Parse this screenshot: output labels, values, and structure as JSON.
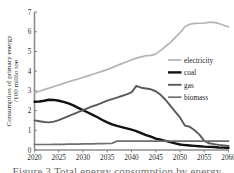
{
  "chart_data": {
    "type": "line",
    "title": "",
    "xlabel": "",
    "ylabel": "Consumption of primary energy /100 millio toe",
    "ylabel_line1": "Consumption of primary energy",
    "ylabel_line2": "/100 millio toe",
    "xlim": [
      2020,
      2060
    ],
    "ylim": [
      0,
      7
    ],
    "yticks": [
      0,
      1,
      2,
      3,
      4,
      5,
      6,
      7
    ],
    "xticks": [
      2020,
      2025,
      2030,
      2035,
      2040,
      2045,
      2050,
      2055,
      2060
    ],
    "xtick_labels": [
      "2020",
      "2025",
      "2030",
      "2035",
      "2040",
      "2045",
      "2050",
      "2055",
      "2060"
    ],
    "ytick_labels": [
      "0",
      "1",
      "2",
      "3",
      "4",
      "5",
      "6",
      "7"
    ],
    "grid": false,
    "legend_position": "center-right",
    "x": [
      2020,
      2021,
      2022,
      2023,
      2024,
      2025,
      2026,
      2027,
      2028,
      2029,
      2030,
      2031,
      2032,
      2033,
      2034,
      2035,
      2036,
      2037,
      2038,
      2039,
      2040,
      2041,
      2042,
      2043,
      2044,
      2045,
      2046,
      2047,
      2048,
      2049,
      2050,
      2051,
      2052,
      2053,
      2054,
      2055,
      2056,
      2057,
      2058,
      2059,
      2060
    ],
    "series": [
      {
        "name": "electricity",
        "color": "#b4b4b4",
        "width": 1.7,
        "values": [
          2.9,
          2.98,
          3.06,
          3.14,
          3.22,
          3.3,
          3.38,
          3.46,
          3.53,
          3.6,
          3.68,
          3.76,
          3.84,
          3.92,
          4.0,
          4.08,
          4.18,
          4.28,
          4.38,
          4.48,
          4.58,
          4.66,
          4.72,
          4.78,
          4.8,
          4.86,
          5.05,
          5.25,
          5.45,
          5.7,
          5.95,
          6.25,
          6.38,
          6.42,
          6.43,
          6.44,
          6.48,
          6.47,
          6.42,
          6.33,
          6.25
        ]
      },
      {
        "name": "coal",
        "color": "#121212",
        "width": 2.4,
        "values": [
          2.45,
          2.46,
          2.5,
          2.55,
          2.54,
          2.5,
          2.44,
          2.36,
          2.26,
          2.14,
          2.02,
          1.9,
          1.78,
          1.66,
          1.52,
          1.4,
          1.3,
          1.22,
          1.16,
          1.1,
          1.03,
          0.96,
          0.86,
          0.76,
          0.68,
          0.58,
          0.52,
          0.46,
          0.4,
          0.34,
          0.28,
          0.25,
          0.23,
          0.21,
          0.19,
          0.17,
          0.16,
          0.15,
          0.13,
          0.12,
          0.1
        ]
      },
      {
        "name": "gas",
        "color": "#5a5a5a",
        "width": 1.9,
        "values": [
          1.5,
          1.46,
          1.42,
          1.4,
          1.44,
          1.52,
          1.62,
          1.72,
          1.82,
          1.92,
          2.02,
          2.12,
          2.22,
          2.3,
          2.4,
          2.5,
          2.58,
          2.66,
          2.74,
          2.82,
          2.92,
          3.25,
          3.16,
          3.12,
          3.08,
          2.98,
          2.8,
          2.55,
          2.25,
          1.95,
          1.65,
          1.24,
          1.18,
          1.0,
          0.78,
          0.46,
          0.34,
          0.3,
          0.26,
          0.23,
          0.2
        ]
      },
      {
        "name": "biomass",
        "color": "#6e6e6e",
        "width": 1.7,
        "values": [
          0.28,
          0.28,
          0.28,
          0.28,
          0.29,
          0.29,
          0.29,
          0.3,
          0.3,
          0.3,
          0.31,
          0.31,
          0.31,
          0.32,
          0.32,
          0.33,
          0.34,
          0.45,
          0.45,
          0.45,
          0.45,
          0.45,
          0.45,
          0.45,
          0.45,
          0.45,
          0.45,
          0.45,
          0.45,
          0.45,
          0.45,
          0.45,
          0.45,
          0.45,
          0.45,
          0.45,
          0.45,
          0.45,
          0.45,
          0.45,
          0.45
        ]
      }
    ],
    "legend": [
      {
        "label": "electricity",
        "color": "#b4b4b4"
      },
      {
        "label": "coal",
        "color": "#121212"
      },
      {
        "label": "gas",
        "color": "#5a5a5a"
      },
      {
        "label": "biomass",
        "color": "#6e6e6e"
      }
    ]
  },
  "caption": {
    "text": "Figure 3 Total energy consumption by energy carrier"
  }
}
